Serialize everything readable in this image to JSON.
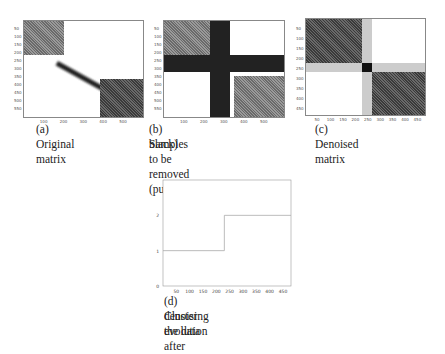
{
  "figures": [
    {
      "id": "a",
      "caption": "(a) Original matrix",
      "xticks": [
        "100",
        "200",
        "300",
        "400",
        "500"
      ],
      "yticks": [
        "50",
        "100",
        "150",
        "200",
        "250",
        "300",
        "350",
        "400",
        "450",
        "500",
        "550"
      ]
    },
    {
      "id": "b",
      "caption_line1": "(b) Samples to be removed (pure",
      "caption_line2": "black)",
      "xticks": [
        "100",
        "200",
        "300",
        "400",
        "500"
      ],
      "yticks": [
        "50",
        "100",
        "150",
        "200",
        "250",
        "300",
        "350",
        "400",
        "450",
        "500",
        "550"
      ]
    },
    {
      "id": "c",
      "caption": "(c) Denoised matrix",
      "xticks": [
        "50",
        "100",
        "150",
        "200",
        "250",
        "300",
        "350",
        "400",
        "450"
      ],
      "yticks": [
        "50",
        "100",
        "150",
        "200",
        "250",
        "300",
        "350",
        "400",
        "450"
      ]
    },
    {
      "id": "d",
      "caption_line1": "(d) Cluster evolution after",
      "caption_line2": "denoising the data"
    }
  ],
  "chart_data": {
    "type": "line",
    "title": "",
    "xlabel": "",
    "ylabel": "",
    "xticks": [
      "50",
      "100",
      "150",
      "200",
      "250",
      "300",
      "350",
      "400",
      "450"
    ],
    "yticks": [
      "0",
      "1",
      "2"
    ],
    "xlim": [
      0,
      480
    ],
    "ylim": [
      0,
      3
    ],
    "series": [
      {
        "name": "clusters",
        "x": [
          0,
          230,
          230,
          480
        ],
        "y": [
          1,
          1,
          2,
          2
        ]
      }
    ]
  }
}
